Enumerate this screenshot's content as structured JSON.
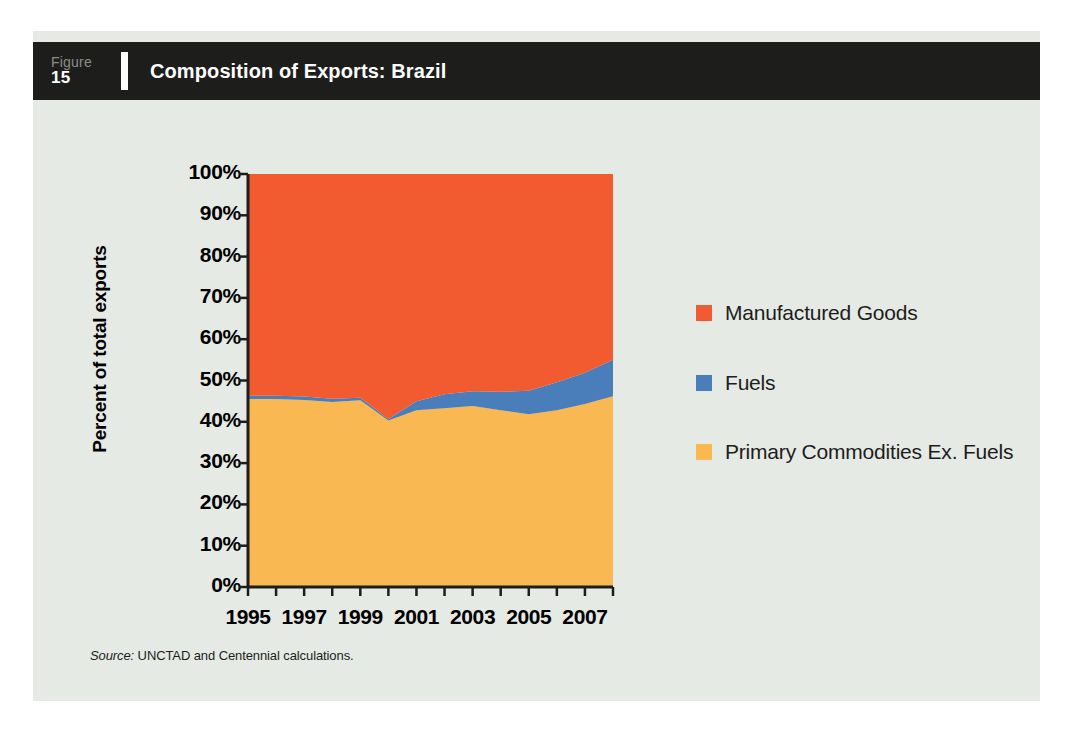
{
  "figure": {
    "label_word": "Figure",
    "number": "15",
    "title": "Composition of Exports: Brazil"
  },
  "source": {
    "lead": "Source:",
    "text": " UNCTAD and Centennial calculations."
  },
  "colors": {
    "manufactured_goods": "#f25b2f",
    "fuels": "#4a7ebb",
    "primary_commodities": "#f9b851",
    "panel_background": "#e5eae5",
    "header_background": "#1d1d1b",
    "axis": "#1d1d1b",
    "text": "#1d1d1b"
  },
  "chart_data": {
    "type": "area",
    "stacked": true,
    "title": "Composition of Exports: Brazil",
    "xlabel": "",
    "ylabel": "Percent of total exports",
    "ylim": [
      0,
      100
    ],
    "xlim": [
      1995,
      2008
    ],
    "grid": false,
    "legend_position": "right",
    "y_ticks": [
      "0%",
      "10%",
      "20%",
      "30%",
      "40%",
      "50%",
      "60%",
      "70%",
      "80%",
      "90%",
      "100%"
    ],
    "y_tick_values": [
      0,
      10,
      20,
      30,
      40,
      50,
      60,
      70,
      80,
      90,
      100
    ],
    "x_ticks": [
      "1995",
      "1997",
      "1999",
      "2001",
      "2003",
      "2005",
      "2007"
    ],
    "x_tick_values": [
      1995,
      1997,
      1999,
      2001,
      2003,
      2005,
      2007
    ],
    "x_minor_tick_values": [
      1995,
      1996,
      1997,
      1998,
      1999,
      2000,
      2001,
      2002,
      2003,
      2004,
      2005,
      2006,
      2007,
      2008
    ],
    "x": [
      1995,
      1996,
      1997,
      1998,
      1999,
      2000,
      2001,
      2002,
      2003,
      2004,
      2005,
      2006,
      2007,
      2008
    ],
    "series": [
      {
        "name": "Primary Commodities Ex. Fuels",
        "color": "#f9b851",
        "values": [
          45.5,
          45.5,
          45.3,
          44.8,
          45.2,
          40.3,
          42.8,
          43.3,
          43.8,
          42.8,
          41.8,
          42.8,
          44.3,
          46.2
        ]
      },
      {
        "name": "Fuels",
        "color": "#4a7ebb",
        "values": [
          0.8,
          0.8,
          0.8,
          0.8,
          0.6,
          0.4,
          2.2,
          3.4,
          3.6,
          4.5,
          5.7,
          6.8,
          7.6,
          8.8
        ]
      },
      {
        "name": "Manufactured Goods",
        "color": "#f25b2f",
        "values": [
          53.7,
          53.7,
          53.9,
          54.4,
          54.2,
          59.3,
          55.0,
          53.3,
          52.6,
          52.7,
          52.5,
          50.4,
          48.1,
          45.0
        ]
      }
    ],
    "cumulative_tops": {
      "primary_commodities": [
        45.5,
        45.5,
        45.3,
        44.8,
        45.2,
        40.3,
        42.8,
        43.3,
        43.8,
        42.8,
        41.8,
        42.8,
        44.3,
        46.2
      ],
      "primary_plus_fuels": [
        46.3,
        46.3,
        46.1,
        45.6,
        45.8,
        40.7,
        45.0,
        46.7,
        47.4,
        47.3,
        47.5,
        49.6,
        51.9,
        55.0
      ],
      "total": [
        100,
        100,
        100,
        100,
        100,
        100,
        100,
        100,
        100,
        100,
        100,
        100,
        100,
        100
      ]
    }
  },
  "legend": {
    "items": [
      {
        "label": "Manufactured Goods",
        "color": "#f25b2f",
        "series_key": "manufactured-goods"
      },
      {
        "label": "Fuels",
        "color": "#4a7ebb",
        "series_key": "fuels"
      },
      {
        "label": "Primary Commodities Ex. Fuels",
        "color": "#f9b851",
        "series_key": "primary-commodities"
      }
    ]
  }
}
